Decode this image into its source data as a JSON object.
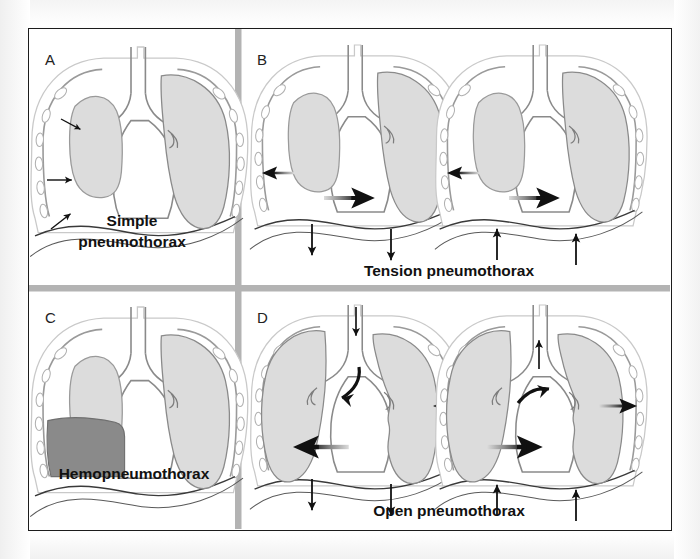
{
  "figure": {
    "background_color": "#ffffff",
    "border_color": "#1c1c1c",
    "divider_color": "#b3b3b3"
  },
  "colors": {
    "lung_fill": "#dcdcdc",
    "lung_outline": "#8a8a8a",
    "chest_wall": "#9a9a9a",
    "rib_fill": "#ffffff",
    "blood_fill": "#8a8a8a",
    "arrow_dark": "#111111",
    "arrow_gradient_light": "#d8d8d8",
    "text": "#111111"
  },
  "panels": [
    {
      "letter": "A",
      "label": "Simple pneumothorax",
      "label_lines": [
        "Simple",
        "pneumothorax"
      ],
      "label_position": "inside-bottom-center",
      "views": 1,
      "findings": [
        "collapsed right lung",
        "air in pleural space",
        "three small arrows indicating pleural air",
        "no mediastinal shift"
      ],
      "arrows": [
        {
          "name": "pleural-air-arrow-upper",
          "direction": "right-down",
          "style": "thin-solid"
        },
        {
          "name": "pleural-air-arrow-middle",
          "direction": "right",
          "style": "thin-solid"
        },
        {
          "name": "pleural-air-arrow-lower",
          "direction": "right-up",
          "style": "thin-solid"
        }
      ]
    },
    {
      "letter": "B",
      "label": "Tension pneumothorax",
      "label_lines": [
        "Tension pneumothorax"
      ],
      "label_position": "below-both-views-center",
      "views": 2,
      "view_names": [
        "inspiration",
        "expiration"
      ],
      "findings": [
        "collapsed right lung under tension",
        "mediastinal shift to the opposite side",
        "diaphragm displaced downward (left view)",
        "diaphragm rises (right view)"
      ],
      "arrows": [
        {
          "name": "lung-collapse-arrow",
          "direction": "left",
          "style": "gradient-barbed"
        },
        {
          "name": "mediastinal-shift-arrow",
          "direction": "right",
          "style": "gradient-barbed-large"
        },
        {
          "name": "diaphragm-arrow-left",
          "direction": "down",
          "style": "thin-solid"
        },
        {
          "name": "diaphragm-arrow-right",
          "direction": "down",
          "style": "thin-solid"
        },
        {
          "name": "diaphragm-arrow-left-2",
          "direction": "up",
          "style": "thin-solid"
        },
        {
          "name": "diaphragm-arrow-right-2",
          "direction": "up",
          "style": "thin-solid"
        }
      ]
    },
    {
      "letter": "C",
      "label": "Hemopneumothorax",
      "label_lines": [
        "Hemopneumothorax"
      ],
      "label_position": "inside-bottom-center",
      "views": 1,
      "findings": [
        "collapsed right lung",
        "blood collection in dependent pleural space",
        "air-fluid level with meniscus"
      ],
      "arrows": []
    },
    {
      "letter": "D",
      "label": "Open pneumothorax",
      "label_lines": [
        "Open pneumothorax"
      ],
      "label_position": "below-both-views-center",
      "views": 2,
      "view_names": [
        "inspiration",
        "expiration"
      ],
      "findings": [
        "chest wall defect (sucking chest wound)",
        "air enters through the wound on inspiration",
        "paradoxical mediastinal swing",
        "air exits on expiration"
      ],
      "arrows": [
        {
          "name": "tracheal-airflow-arrow-in",
          "direction": "down",
          "style": "thick-solid"
        },
        {
          "name": "bronchial-airflow-arrow-in",
          "direction": "curved-down-left",
          "style": "curved-solid"
        },
        {
          "name": "chest-wound-air-in-arrow",
          "direction": "left",
          "style": "gradient-barbed"
        },
        {
          "name": "mediastinal-swing-arrow-left",
          "direction": "left",
          "style": "gradient-barbed-large"
        },
        {
          "name": "diaphragm-arrow-left",
          "direction": "down",
          "style": "thin-solid"
        },
        {
          "name": "diaphragm-arrow-right",
          "direction": "down",
          "style": "thin-solid"
        },
        {
          "name": "tracheal-airflow-arrow-out",
          "direction": "up",
          "style": "thick-solid"
        },
        {
          "name": "bronchial-airflow-arrow-out",
          "direction": "curved-up-right",
          "style": "curved-solid"
        },
        {
          "name": "chest-wound-air-out-arrow",
          "direction": "right",
          "style": "gradient-barbed"
        },
        {
          "name": "mediastinal-swing-arrow-right",
          "direction": "right",
          "style": "gradient-barbed-large"
        },
        {
          "name": "diaphragm-arrow-left-2",
          "direction": "up",
          "style": "thin-solid"
        },
        {
          "name": "diaphragm-arrow-right-2",
          "direction": "up",
          "style": "thin-solid"
        }
      ]
    }
  ]
}
